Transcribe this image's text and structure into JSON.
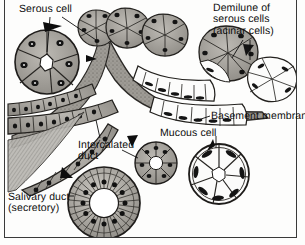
{
  "figure": {
    "background_color": "#fdfdfc",
    "border_color": "#3a3a3a",
    "ink_color": "#0d0d0d",
    "serous_tint": "#9a9a96",
    "mucous_tint": "#ffffff",
    "stroma_tint": "#8d8a84",
    "nucleus_color": "#141414"
  },
  "labels": {
    "serous_cell": "Serous cell",
    "demilune": "Demilune of\nserous cells\n(acinar cells)",
    "basement_membrane": "Basement membrane",
    "mucous_cell": "Mucous cell",
    "intercalated_duct": "Intercalated\nduct",
    "salivary_duct": "Salivary duct\n(secretory)"
  },
  "structures": {
    "serous_acinus_inset": {
      "name": "serous-acinus-inset",
      "cells": 7,
      "lumen": "star-shaped"
    },
    "mucous_acinus_inset": {
      "name": "mucous-acinus-inset",
      "cells": 8,
      "lumen": "round"
    },
    "intercalated_duct_inset": {
      "name": "intercalated-duct-inset",
      "cells": 9,
      "lumen": "round"
    },
    "salivary_duct_inset": {
      "name": "salivary-duct-inset",
      "cells": 26,
      "lumen": "round"
    },
    "main_gland": {
      "name": "main-gland-section",
      "description": "branching acini and ducts"
    }
  }
}
